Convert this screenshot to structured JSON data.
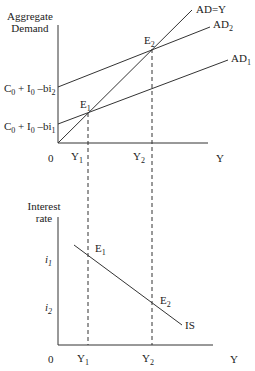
{
  "top_panel": {
    "y_axis_label_line1": "Aggregate",
    "y_axis_label_line2": "Demand",
    "x_axis_label": "Y",
    "origin": "0",
    "intercept_high": {
      "main": "C",
      "s0": "0",
      "plus": " + I",
      "s1": "0",
      "minus": " –bi",
      "s2": "2"
    },
    "intercept_low": {
      "main": "C",
      "s0": "0",
      "plus": " + I",
      "s1": "0",
      "minus": " –bi",
      "s2": "1"
    },
    "lines": {
      "ad_y": "AD=Y",
      "ad2": {
        "main": "AD",
        "sub": "2"
      },
      "ad1": {
        "main": "AD",
        "sub": "1"
      }
    },
    "points": {
      "e1": {
        "main": "E",
        "sub": "1"
      },
      "e2": {
        "main": "E",
        "sub": "2"
      }
    },
    "ticks": {
      "y1": {
        "main": "Y",
        "sub": "1"
      },
      "y2": {
        "main": "Y",
        "sub": "2"
      }
    }
  },
  "bottom_panel": {
    "y_axis_label_line1": "Interest",
    "y_axis_label_line2": "rate",
    "x_axis_label": "Y",
    "origin": "0",
    "i1": {
      "main": "i",
      "sub": "1"
    },
    "i2": {
      "main": "i",
      "sub": "2"
    },
    "curve": "IS",
    "points": {
      "e1": {
        "main": "E",
        "sub": "1"
      },
      "e2": {
        "main": "E",
        "sub": "2"
      }
    },
    "ticks": {
      "y1": {
        "main": "Y",
        "sub": "1"
      },
      "y2": {
        "main": "Y",
        "sub": "2"
      }
    }
  }
}
